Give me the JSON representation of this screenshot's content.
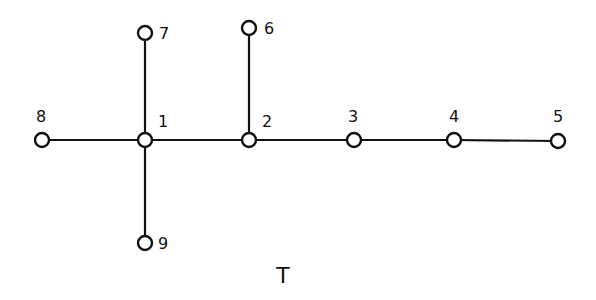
{
  "diagram": {
    "type": "tree",
    "caption": "T",
    "nodes": [
      {
        "id": "1",
        "label": "1",
        "x": 145,
        "y": 140,
        "lx": 158,
        "ly": 127
      },
      {
        "id": "2",
        "label": "2",
        "x": 249,
        "y": 140,
        "lx": 262,
        "ly": 127
      },
      {
        "id": "3",
        "label": "3",
        "x": 354,
        "y": 140,
        "lx": 348,
        "ly": 122
      },
      {
        "id": "4",
        "label": "4",
        "x": 454,
        "y": 140,
        "lx": 449,
        "ly": 122
      },
      {
        "id": "5",
        "label": "5",
        "x": 558,
        "y": 141,
        "lx": 553,
        "ly": 122
      },
      {
        "id": "6",
        "label": "6",
        "x": 249,
        "y": 28,
        "lx": 264,
        "ly": 34
      },
      {
        "id": "7",
        "label": "7",
        "x": 145,
        "y": 33,
        "lx": 159,
        "ly": 39
      },
      {
        "id": "8",
        "label": "8",
        "x": 42,
        "y": 140,
        "lx": 36,
        "ly": 122
      },
      {
        "id": "9",
        "label": "9",
        "x": 145,
        "y": 243,
        "lx": 158,
        "ly": 249
      }
    ],
    "edges": [
      [
        "8",
        "1"
      ],
      [
        "1",
        "2"
      ],
      [
        "2",
        "3"
      ],
      [
        "3",
        "4"
      ],
      [
        "4",
        "5"
      ],
      [
        "1",
        "7"
      ],
      [
        "1",
        "9"
      ],
      [
        "2",
        "6"
      ]
    ]
  }
}
